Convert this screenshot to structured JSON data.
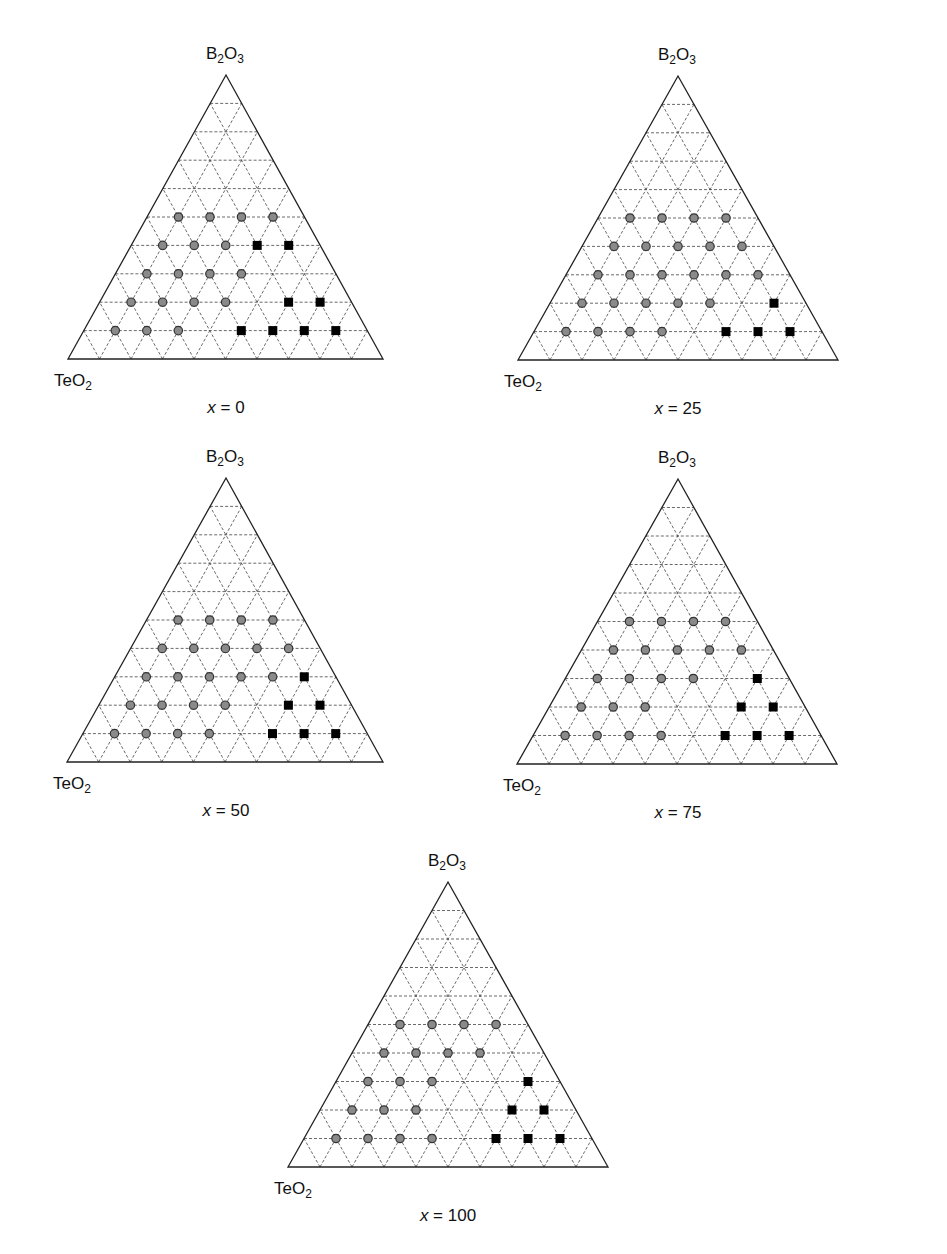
{
  "figure": {
    "marker_legend": {
      "circle": "gray filled circle (glass-forming composition)",
      "square": "black filled square (non-glass / crystallized composition)"
    },
    "colors": {
      "circle_fill": "#8a8a8a",
      "circle_stroke": "#333333",
      "square_fill": "#000000",
      "grid": "#444444",
      "edge": "#222222"
    }
  },
  "chart_data": [
    {
      "type": "scatter",
      "subtype": "ternary",
      "title": "x = 0",
      "caption_var": "x",
      "caption_value": "0",
      "vertices": {
        "top": "B2O3",
        "left": "TeO2",
        "right": "[0BaF2. 100BaO]"
      },
      "right_label_parts": [
        "[0BaF",
        "2",
        ". 100BaO]"
      ],
      "grid_step": 10,
      "geometry": {
        "left": [
          68,
          359
        ],
        "right": [
          383,
          359
        ],
        "apex": [
          226,
          75
        ]
      },
      "points": {
        "circle": [
          [
            10,
            10
          ],
          [
            10,
            20
          ],
          [
            10,
            30
          ],
          [
            20,
            10
          ],
          [
            20,
            20
          ],
          [
            20,
            30
          ],
          [
            20,
            40
          ],
          [
            30,
            10
          ],
          [
            30,
            20
          ],
          [
            30,
            30
          ],
          [
            30,
            40
          ],
          [
            40,
            10
          ],
          [
            40,
            20
          ],
          [
            40,
            30
          ],
          [
            50,
            10
          ],
          [
            50,
            20
          ],
          [
            50,
            30
          ],
          [
            50,
            40
          ]
        ],
        "square": [
          [
            10,
            50
          ],
          [
            10,
            60
          ],
          [
            10,
            70
          ],
          [
            10,
            80
          ],
          [
            20,
            60
          ],
          [
            20,
            70
          ],
          [
            40,
            40
          ],
          [
            40,
            50
          ]
        ]
      },
      "point_format": "[B2O3 %, right-vertex component %]"
    },
    {
      "type": "scatter",
      "subtype": "ternary",
      "title": "x = 25",
      "caption_var": "x",
      "caption_value": "25",
      "vertices": {
        "top": "B2O3",
        "left": "TeO2",
        "right": "[25BaF2. 75BaO]"
      },
      "right_label_parts": [
        "[25BaF",
        "2",
        ". 75BaO]"
      ],
      "grid_step": 10,
      "geometry": {
        "left": [
          518,
          360
        ],
        "right": [
          838,
          360
        ],
        "apex": [
          678,
          76
        ]
      },
      "points": {
        "circle": [
          [
            10,
            10
          ],
          [
            10,
            20
          ],
          [
            10,
            30
          ],
          [
            10,
            40
          ],
          [
            20,
            10
          ],
          [
            20,
            20
          ],
          [
            20,
            30
          ],
          [
            20,
            40
          ],
          [
            20,
            50
          ],
          [
            30,
            10
          ],
          [
            30,
            20
          ],
          [
            30,
            30
          ],
          [
            30,
            40
          ],
          [
            30,
            50
          ],
          [
            30,
            60
          ],
          [
            40,
            10
          ],
          [
            40,
            20
          ],
          [
            40,
            30
          ],
          [
            40,
            40
          ],
          [
            40,
            50
          ],
          [
            50,
            10
          ],
          [
            50,
            20
          ],
          [
            50,
            30
          ],
          [
            50,
            40
          ]
        ],
        "square": [
          [
            10,
            60
          ],
          [
            10,
            70
          ],
          [
            10,
            80
          ],
          [
            20,
            70
          ]
        ]
      },
      "point_format": "[B2O3 %, right-vertex component %]"
    },
    {
      "type": "scatter",
      "subtype": "ternary",
      "title": "x = 50",
      "caption_var": "x",
      "caption_value": "50",
      "vertices": {
        "top": "B2O3",
        "left": "TeO2",
        "right": "[50BaF2. 50BaO]"
      },
      "right_label_parts": [
        "[50BaF",
        "2",
        ". 50BaO]"
      ],
      "grid_step": 10,
      "geometry": {
        "left": [
          67,
          762
        ],
        "right": [
          383,
          762
        ],
        "apex": [
          226,
          478
        ]
      },
      "points": {
        "circle": [
          [
            10,
            10
          ],
          [
            10,
            20
          ],
          [
            10,
            30
          ],
          [
            10,
            40
          ],
          [
            20,
            10
          ],
          [
            20,
            20
          ],
          [
            20,
            30
          ],
          [
            20,
            40
          ],
          [
            30,
            10
          ],
          [
            30,
            20
          ],
          [
            30,
            30
          ],
          [
            30,
            40
          ],
          [
            30,
            50
          ],
          [
            40,
            10
          ],
          [
            40,
            20
          ],
          [
            40,
            30
          ],
          [
            40,
            40
          ],
          [
            40,
            50
          ],
          [
            50,
            10
          ],
          [
            50,
            20
          ],
          [
            50,
            30
          ],
          [
            50,
            40
          ]
        ],
        "square": [
          [
            10,
            60
          ],
          [
            10,
            70
          ],
          [
            10,
            80
          ],
          [
            20,
            60
          ],
          [
            20,
            70
          ],
          [
            30,
            60
          ]
        ]
      },
      "point_format": "[B2O3 %, right-vertex component %]"
    },
    {
      "type": "scatter",
      "subtype": "ternary",
      "title": "x = 75",
      "caption_var": "x",
      "caption_value": "75",
      "vertices": {
        "top": "B2O3",
        "left": "TeO2",
        "right": "[75BaF2. 25BaO]"
      },
      "right_label_parts": [
        "[75BaF",
        "2",
        ". 25BaO]"
      ],
      "grid_step": 10,
      "geometry": {
        "left": [
          517,
          764
        ],
        "right": [
          837,
          764
        ],
        "apex": [
          678,
          479
        ]
      },
      "points": {
        "circle": [
          [
            10,
            10
          ],
          [
            10,
            20
          ],
          [
            10,
            30
          ],
          [
            10,
            40
          ],
          [
            20,
            10
          ],
          [
            20,
            20
          ],
          [
            20,
            30
          ],
          [
            30,
            10
          ],
          [
            30,
            20
          ],
          [
            30,
            30
          ],
          [
            30,
            40
          ],
          [
            40,
            10
          ],
          [
            40,
            20
          ],
          [
            40,
            30
          ],
          [
            40,
            40
          ],
          [
            40,
            50
          ],
          [
            50,
            10
          ],
          [
            50,
            20
          ],
          [
            50,
            30
          ],
          [
            50,
            40
          ]
        ],
        "square": [
          [
            10,
            60
          ],
          [
            10,
            70
          ],
          [
            10,
            80
          ],
          [
            20,
            60
          ],
          [
            20,
            70
          ],
          [
            30,
            60
          ]
        ]
      },
      "point_format": "[B2O3 %, right-vertex component %]"
    },
    {
      "type": "scatter",
      "subtype": "ternary",
      "title": "x = 100",
      "caption_var": "x",
      "caption_value": "100",
      "vertices": {
        "top": "B2O3",
        "left": "TeO2",
        "right": "[100BaF2. 0BaO]"
      },
      "right_label_parts": [
        "[100BaF",
        "2",
        ". 0BaO]"
      ],
      "grid_step": 10,
      "geometry": {
        "left": [
          288,
          1167
        ],
        "right": [
          608,
          1167
        ],
        "apex": [
          448,
          882
        ]
      },
      "points": {
        "circle": [
          [
            10,
            10
          ],
          [
            10,
            20
          ],
          [
            10,
            30
          ],
          [
            10,
            40
          ],
          [
            20,
            10
          ],
          [
            20,
            20
          ],
          [
            20,
            30
          ],
          [
            30,
            10
          ],
          [
            30,
            20
          ],
          [
            30,
            30
          ],
          [
            40,
            10
          ],
          [
            40,
            20
          ],
          [
            40,
            30
          ],
          [
            40,
            40
          ],
          [
            50,
            10
          ],
          [
            50,
            20
          ],
          [
            50,
            30
          ],
          [
            50,
            40
          ]
        ],
        "square": [
          [
            10,
            60
          ],
          [
            10,
            70
          ],
          [
            10,
            80
          ],
          [
            20,
            60
          ],
          [
            20,
            70
          ],
          [
            30,
            60
          ]
        ]
      },
      "point_format": "[B2O3 %, right-vertex component %]"
    }
  ]
}
